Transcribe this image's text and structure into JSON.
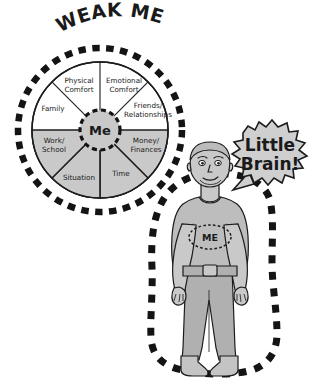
{
  "canvas": {
    "width": 331,
    "height": 389,
    "background": "#ffffff"
  },
  "title": {
    "text": "WEAK ME"
  },
  "wheel": {
    "center_label": "Me",
    "segments": [
      {
        "label_line1": "Physical",
        "label_line2": "Comfort",
        "shaded": false
      },
      {
        "label_line1": "Emotional",
        "label_line2": "Comfort",
        "shaded": false
      },
      {
        "label_line1": "Friends/",
        "label_line2": "Relationships",
        "shaded": false
      },
      {
        "label_line1": "Money/",
        "label_line2": "Finances",
        "shaded": true
      },
      {
        "label_line1": "Time",
        "label_line2": "",
        "shaded": true
      },
      {
        "label_line1": "Situation",
        "label_line2": "",
        "shaded": true
      },
      {
        "label_line1": "Work/",
        "label_line2": "School",
        "shaded": true
      },
      {
        "label_line1": "Family",
        "label_line2": "",
        "shaded": false
      }
    ]
  },
  "figure": {
    "shirt_label": "ME"
  },
  "speech_bubble": {
    "line1": "Little",
    "line2": "Brain!"
  },
  "colors": {
    "ink": "#1c1c1c",
    "shade_gray": "#c9c9c9",
    "bubble_gray": "#cfcfcf",
    "paper": "#ffffff"
  }
}
